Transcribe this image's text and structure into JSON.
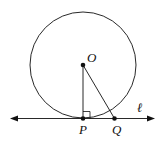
{
  "diagram": {
    "labels": {
      "center": "O",
      "tangent_point": "P",
      "point_on_line": "Q",
      "line": "ℓ"
    },
    "colors": {
      "stroke": "#111111",
      "background": "#ffffff"
    },
    "relations": [
      "OP ⟂ ℓ",
      "Q lies on ℓ",
      "OQ segment drawn"
    ]
  }
}
